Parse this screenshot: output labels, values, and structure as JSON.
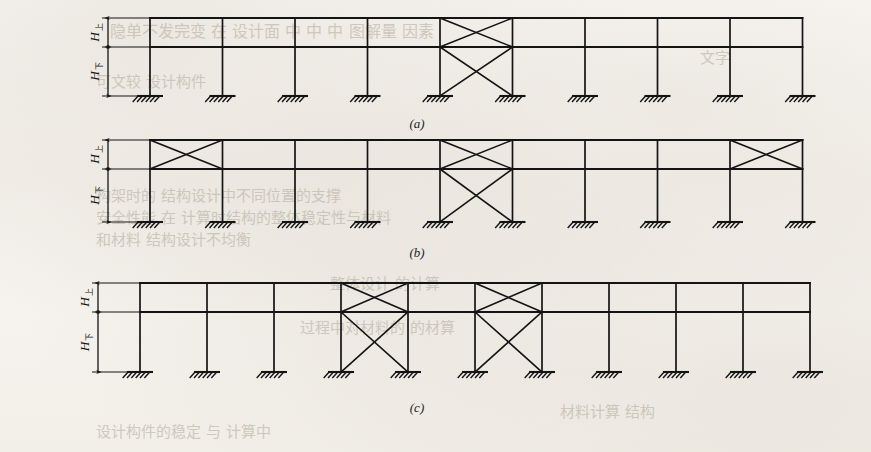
{
  "figure": {
    "ink_color": "#141414",
    "paper_color": "#f4f1eb",
    "captions": [
      {
        "id": "a",
        "text": "(a)"
      },
      {
        "id": "b",
        "text": "(b)"
      },
      {
        "id": "c",
        "text": "(c)"
      }
    ],
    "dimension_labels": {
      "upper": {
        "symbol": "H",
        "subscript": "上",
        "meaning": "upper storey height"
      },
      "lower": {
        "symbol": "H",
        "subscript": "下",
        "meaning": "lower storey height"
      }
    },
    "support_type": "fixed-base-hatched",
    "frames": [
      {
        "id": "a",
        "caption": "(a)",
        "columns": 10,
        "bays": 9,
        "levels": 2,
        "upper_braced_bays": [
          5
        ],
        "lower_braced_bays": [
          5
        ],
        "brace_style": "X",
        "dimension_labels_shown": [
          "upper",
          "lower"
        ]
      },
      {
        "id": "b",
        "caption": "(b)",
        "columns": 10,
        "bays": 9,
        "levels": 2,
        "upper_braced_bays": [
          1,
          5,
          9
        ],
        "lower_braced_bays": [
          5
        ],
        "brace_style": "X",
        "dimension_labels_shown": [
          "upper",
          "lower"
        ]
      },
      {
        "id": "c",
        "caption": "(c)",
        "columns": 11,
        "bays": 10,
        "levels": 2,
        "upper_braced_bays": [
          4,
          6
        ],
        "lower_braced_bays": [
          4,
          6
        ],
        "brace_style": "X",
        "dimension_labels_shown": [
          "upper",
          "lower"
        ]
      }
    ]
  },
  "bleed_through_text": [
    {
      "text": "隐单不发完变 在 设计面 中 中 中 图解量 因素",
      "x": 110,
      "y": 18,
      "size": 16
    },
    {
      "text": "文字",
      "x": 700,
      "y": 46,
      "size": 15
    },
    {
      "text": "可文较 设计构件",
      "x": 96,
      "y": 70,
      "size": 15
    },
    {
      "text": "构架时的 结构设计中不同位置的支撑",
      "x": 96,
      "y": 184,
      "size": 15
    },
    {
      "text": "安全性能 在 计算时结构的整体稳定性与材料",
      "x": 96,
      "y": 206,
      "size": 15
    },
    {
      "text": "和材料 结构设计不均衡",
      "x": 96,
      "y": 228,
      "size": 15
    },
    {
      "text": "整体设计 的计算",
      "x": 330,
      "y": 272,
      "size": 15
    },
    {
      "text": "过程中对材料的 的材算",
      "x": 300,
      "y": 316,
      "size": 15
    },
    {
      "text": "设计构件的稳定 与 计算中",
      "x": 96,
      "y": 420,
      "size": 15
    },
    {
      "text": "材料计算 结构",
      "x": 560,
      "y": 400,
      "size": 15
    }
  ]
}
